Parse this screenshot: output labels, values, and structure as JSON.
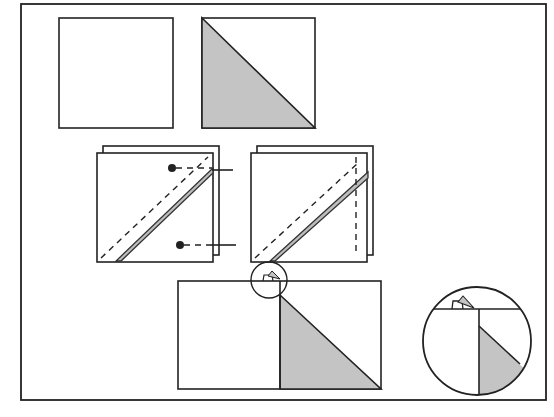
{
  "figure": {
    "colors": {
      "line": "#222222",
      "fabric_light": "#ffffff",
      "fabric_shaded": "#c4c4c4",
      "background": "#ffffff"
    },
    "steps": [
      {
        "id": "step-1",
        "content": "Plain light square and a square divided diagonally with the lower-left triangle shaded"
      },
      {
        "id": "step-2",
        "content": "Two squares stacked right sides together, stitched 1/4 inch on each side of the diagonal; pins marked at top-right and bottom-right"
      },
      {
        "id": "step-3",
        "content": "Stacked squares with the stitched diagonal and a vertical dashed cutting line on the right"
      },
      {
        "id": "step-4",
        "content": "Opened and pressed unit: light rectangle on the left, shaded triangle on the right, circled detail at the seam point"
      },
      {
        "id": "detail",
        "content": "Enlarged circular detail of the seam allowance at the top of the pressed unit"
      }
    ]
  }
}
